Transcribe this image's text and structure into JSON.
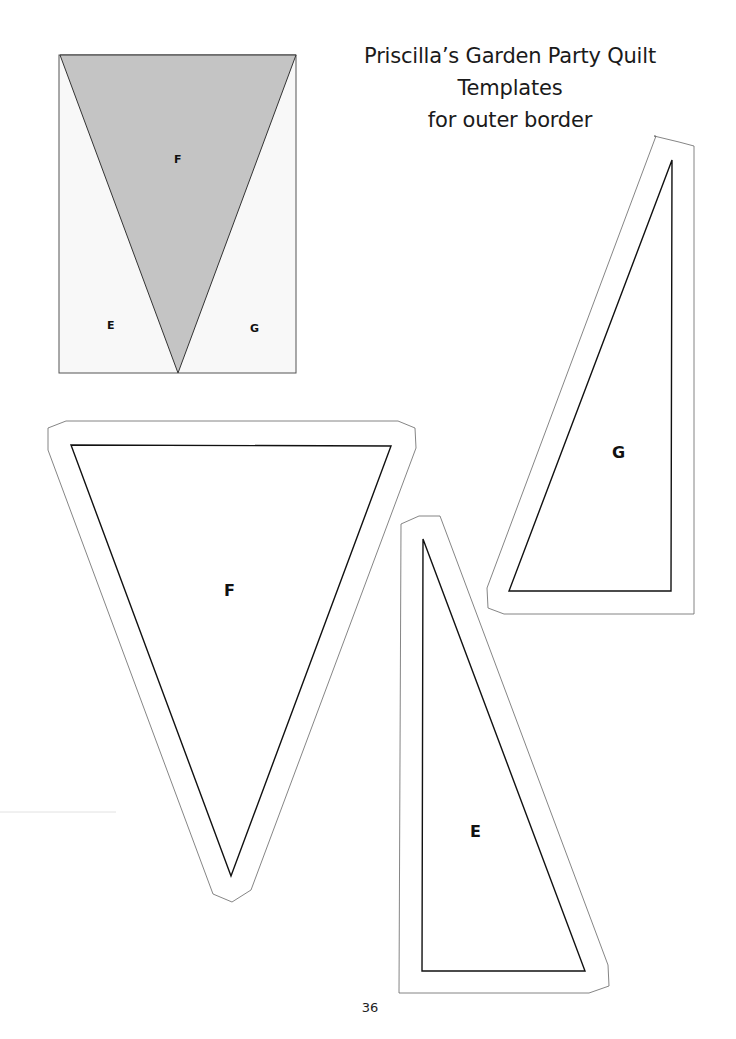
{
  "title": {
    "line1": "Priscilla’s Garden Party Quilt",
    "line2": "Templates",
    "line3": "for outer border"
  },
  "diagram": {
    "block_labels": {
      "left": "E",
      "center": "F",
      "right": "G"
    },
    "fill_color": "#c4c4c4",
    "background_color": "#f8f8f8"
  },
  "templates": {
    "F": {
      "label": "F"
    },
    "G": {
      "label": "G"
    },
    "E": {
      "label": "E"
    }
  },
  "footer": {
    "page_number": "36"
  }
}
